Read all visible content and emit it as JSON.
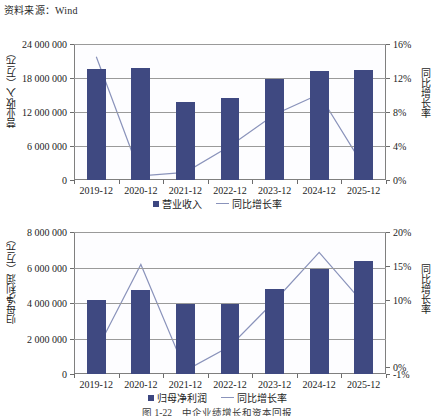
{
  "source_note": "资料来源：Wind",
  "figure_caption": "图 1-22　中企业绩增长和资本回报",
  "chart_data": [
    {
      "id": "revenue",
      "type": "bar",
      "title": "",
      "categories": [
        "2019-12",
        "2020-12",
        "2021-12",
        "2022-12",
        "2023-12",
        "2024-12",
        "2025-12"
      ],
      "series": [
        {
          "name": "营业收入",
          "type": "bar",
          "axis": "left",
          "values": [
            19600000,
            19700000,
            13700000,
            14500000,
            17800000,
            19300000,
            19500000
          ]
        },
        {
          "name": "同比增长率",
          "type": "line",
          "axis": "right",
          "values": [
            0.145,
            0.005,
            0.009,
            0.04,
            0.077,
            0.101,
            0.016
          ]
        }
      ],
      "xlabel": "",
      "ylabel": "营业收入（万元）",
      "y2label": "同比增长率",
      "yticks": [
        "0",
        "6 000 000",
        "12 000 000",
        "18 000 000",
        "24 000 000"
      ],
      "ytick_values": [
        0,
        6000000,
        12000000,
        18000000,
        24000000
      ],
      "ylim": [
        0,
        24000000
      ],
      "y2ticks": [
        "0%",
        "4%",
        "8%",
        "12%",
        "16%"
      ],
      "y2tick_values": [
        0,
        0.04,
        0.08,
        0.12,
        0.16
      ],
      "y2lim": [
        0,
        0.16
      ],
      "grid": true,
      "legend_position": "bottom"
    },
    {
      "id": "net-profit",
      "type": "bar",
      "title": "",
      "categories": [
        "2019-12",
        "2020-12",
        "2021-12",
        "2022-12",
        "2023-12",
        "2024-12",
        "2025-12"
      ],
      "series": [
        {
          "name": "归母净利润",
          "type": "line",
          "axis": "left",
          "values": [
            4150000,
            4750000,
            3960000,
            3960000,
            4780000,
            5900000,
            6350000
          ]
        },
        {
          "name": "同比增长率",
          "type": "line",
          "axis": "right",
          "values": [
            0.024,
            0.152,
            -0.005,
            0.031,
            0.098,
            0.17,
            0.094
          ]
        }
      ],
      "xlabel": "",
      "ylabel": "归母净利润（万元）",
      "y2label": "同比增长率",
      "yticks": [
        "0",
        "2 000 000",
        "4 000 000",
        "6 000 000",
        "8 000 000"
      ],
      "ytick_values": [
        0,
        2000000,
        4000000,
        6000000,
        8000000
      ],
      "ylim": [
        0,
        8000000
      ],
      "y2ticks": [
        "-1%",
        "0%",
        "10%",
        "15%",
        "20%"
      ],
      "y2tick_values": [
        -0.01,
        0.0,
        0.1,
        0.15,
        0.2
      ],
      "y2lim": [
        -0.01,
        0.2
      ],
      "grid": true,
      "legend_position": "bottom"
    }
  ],
  "colors": {
    "bar": "#3f4981",
    "line": "#8a93bb",
    "grid": "#9a9a9a",
    "axis": "#6c6c6c",
    "text": "#1c1c1c"
  }
}
